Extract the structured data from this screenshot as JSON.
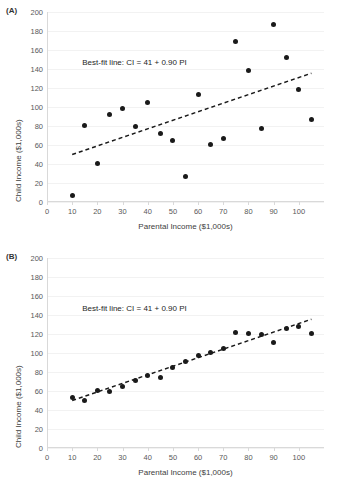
{
  "figure": {
    "background": "#ffffff",
    "marker_color": "#1a1a1a",
    "gridline_color": "#f2f2f2",
    "axis_color": "#d9d9d9"
  },
  "panels": [
    {
      "id": "panel-a",
      "label": "(A)",
      "annotation": "Best-fit line: CI = 41 + 0.90 PI",
      "chart_data": {
        "type": "scatter",
        "title": "",
        "xlabel": "Parental Income ($1,000s)",
        "ylabel": "Child Income ($1,000s)",
        "xlim": [
          0,
          110
        ],
        "ylim": [
          0,
          200
        ],
        "xticks": [
          0,
          10,
          20,
          30,
          40,
          50,
          60,
          70,
          80,
          90,
          100
        ],
        "yticks": [
          0,
          20,
          40,
          60,
          80,
          100,
          120,
          140,
          160,
          180,
          200
        ],
        "grid": true,
        "legend": "none",
        "x": [
          10,
          15,
          20,
          25,
          30,
          35,
          40,
          45,
          50,
          55,
          60,
          65,
          70,
          75,
          80,
          85,
          90,
          95,
          100,
          105
        ],
        "y": [
          7,
          81,
          41,
          92,
          98,
          79,
          105,
          72,
          65,
          27,
          113,
          61,
          67,
          169,
          138,
          77,
          187,
          152,
          118,
          87
        ],
        "fit_line": {
          "intercept": 41,
          "slope": 0.9,
          "equation": "CI = 41 + 0.90 PI",
          "style": "dashed",
          "x_start": 10,
          "x_end": 105
        }
      }
    },
    {
      "id": "panel-b",
      "label": "(B)",
      "annotation": "Best-fit line: CI = 41 + 0.90 PI",
      "chart_data": {
        "type": "scatter",
        "title": "",
        "xlabel": "Parental Income ($1,000s)",
        "ylabel": "Child Income ($1,000s)",
        "xlim": [
          0,
          110
        ],
        "ylim": [
          0,
          200
        ],
        "xticks": [
          0,
          10,
          20,
          30,
          40,
          50,
          60,
          70,
          80,
          90,
          100
        ],
        "yticks": [
          0,
          20,
          40,
          60,
          80,
          100,
          120,
          140,
          160,
          180,
          200
        ],
        "grid": true,
        "legend": "none",
        "x": [
          10,
          15,
          20,
          25,
          30,
          35,
          40,
          45,
          50,
          55,
          60,
          65,
          70,
          75,
          80,
          85,
          90,
          95,
          100,
          105
        ],
        "y": [
          53,
          50,
          61,
          59,
          65,
          71,
          76,
          74,
          85,
          91,
          97,
          101,
          105,
          122,
          121,
          119,
          111,
          126,
          128,
          121
        ],
        "fit_line": {
          "intercept": 41,
          "slope": 0.9,
          "equation": "CI = 41 + 0.90 PI",
          "style": "dashed",
          "x_start": 10,
          "x_end": 105
        }
      }
    }
  ]
}
